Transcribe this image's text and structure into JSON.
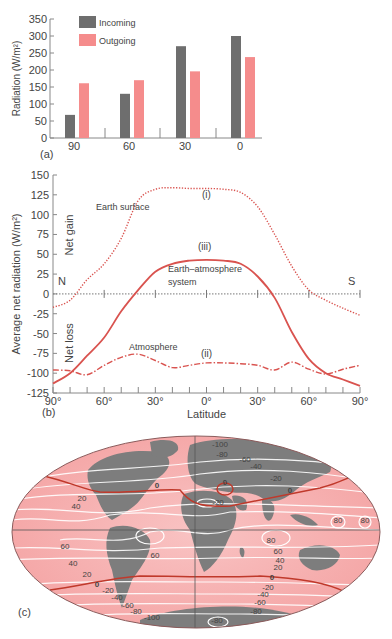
{
  "chart_data": [
    {
      "panel": "(a)",
      "type": "bar",
      "title": "",
      "xlabel": "",
      "ylabel": "Radiation (W/m²)",
      "ylim": [
        0,
        350
      ],
      "yticks": [
        0,
        50,
        100,
        150,
        200,
        250,
        300,
        350
      ],
      "categories": [
        "90",
        "60",
        "30",
        "0"
      ],
      "legend_position": "top-left inside",
      "series": [
        {
          "name": "Incoming",
          "color": "#6e6e6e",
          "values": [
            68,
            130,
            270,
            300
          ]
        },
        {
          "name": "Outgoing",
          "color": "#f58c8c",
          "values": [
            161,
            170,
            196,
            238
          ]
        }
      ]
    },
    {
      "panel": "(b)",
      "type": "line",
      "title": "",
      "xlabel": "Latitude",
      "ylabel": "Average net radiation (W/m²)",
      "ylim": [
        -125,
        150
      ],
      "yticks": [
        -125,
        -100,
        -75,
        -50,
        -25,
        0,
        25,
        50,
        75,
        100,
        125,
        150
      ],
      "xtick_labels": [
        "90°",
        "60°",
        "30°",
        "0°",
        "30°",
        "60°",
        "90°"
      ],
      "x": [
        -90,
        -80,
        -70,
        -60,
        -50,
        -40,
        -30,
        -20,
        -10,
        0,
        10,
        20,
        30,
        40,
        50,
        60,
        70,
        80,
        90
      ],
      "annotations": [
        "N",
        "S",
        "Net gain",
        "Net loss",
        "Earth surface",
        "Earth–atmosphere system",
        "Atmosphere",
        "(i)",
        "(ii)",
        "(iii)"
      ],
      "series": [
        {
          "name": "Earth surface",
          "label": "(i)",
          "style": "dotted",
          "color": "#d9534f",
          "values": [
            -17,
            -8,
            18,
            38,
            70,
            118,
            132,
            134,
            133,
            133,
            132,
            128,
            110,
            75,
            35,
            5,
            -8,
            -18,
            -27
          ]
        },
        {
          "name": "Earth–atmosphere system",
          "label": "(iii)",
          "style": "solid",
          "color": "#d9534f",
          "values": [
            -113,
            -100,
            -78,
            -55,
            -22,
            5,
            28,
            38,
            42,
            43,
            42,
            38,
            22,
            -5,
            -48,
            -82,
            -100,
            -108,
            -116
          ]
        },
        {
          "name": "Atmosphere",
          "label": "(ii)",
          "style": "dash-dot",
          "color": "#d9534f",
          "values": [
            -96,
            -97,
            -102,
            -90,
            -80,
            -76,
            -84,
            -93,
            -90,
            -87,
            -87,
            -88,
            -90,
            -96,
            -86,
            -95,
            -101,
            -95,
            -90
          ]
        }
      ]
    },
    {
      "panel": "(c)",
      "type": "map",
      "title": "",
      "description": "World map (oval projection) with contours of net radiation (W/m²)",
      "contour_labels_north": [
        "-100",
        "-80",
        "-60",
        "-40",
        "-20",
        "0",
        "20",
        "40"
      ],
      "contour_labels_tropics": [
        "60",
        "80",
        "60",
        "80",
        "80",
        "60"
      ],
      "contour_labels_south": [
        "20",
        "0",
        "-20",
        "-40",
        "-60",
        "-80",
        "-100",
        "-80"
      ],
      "zero_line_color": "#c0392b",
      "contour_color": "#ffffff",
      "land_color": "#7d7d7d",
      "ocean_color": "#f4a3a3"
    }
  ],
  "labels": {
    "panel_a": "(a)",
    "panel_b": "(b)",
    "panel_c": "(c)",
    "net_gain": "Net gain",
    "net_loss": "Net loss",
    "north": "N",
    "south": "S",
    "earth_surface": "Earth surface",
    "earth_atm_1": "Earth–atmosphere",
    "earth_atm_2": "system",
    "atmosphere": "Atmosphere",
    "curve_i": "(i)",
    "curve_ii": "(ii)",
    "curve_iii": "(iii)",
    "latitude": "Latitude"
  }
}
